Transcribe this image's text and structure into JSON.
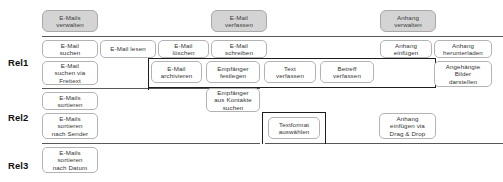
{
  "diagram": {
    "type": "story-map",
    "releases": [
      {
        "id": "rel1",
        "label": "Rel1"
      },
      {
        "id": "rel2",
        "label": "Rel2"
      },
      {
        "id": "rel3",
        "label": "Rel3"
      }
    ],
    "epics": [
      {
        "id": "epic-emails-verwalten",
        "label": "E-Mails\nverwalten"
      },
      {
        "id": "epic-email-verfassen",
        "label": "E-Mail\nverfassen"
      },
      {
        "id": "epic-anhang-verwalten",
        "label": "Anhang\nverwalten"
      }
    ],
    "stories": {
      "rel1_row1": [
        {
          "id": "email-suchen",
          "label": "E-Mail\nsuchen"
        },
        {
          "id": "email-lesen",
          "label": "E-Mail lesen"
        },
        {
          "id": "email-loeschen",
          "label": "E-Mail\nlöschen"
        },
        {
          "id": "email-schreiben",
          "label": "E-Mail\nschreiben"
        },
        {
          "id": "anhang-einfuegen",
          "label": "Anhang\neinfügen"
        },
        {
          "id": "anhang-herunterladen",
          "label": "Anhang\nherunterladen"
        }
      ],
      "rel1_row2": [
        {
          "id": "email-suchen-via-freitext",
          "label": "E-Mail\nsuchen via\nFreitext"
        },
        {
          "id": "email-archivieren",
          "label": "E-Mail\narchivieren"
        },
        {
          "id": "empfaenger-festlegen",
          "label": "Empfänger\nfestlegen"
        },
        {
          "id": "text-verfassen",
          "label": "Text\nverfassen"
        },
        {
          "id": "betreff-verfassen",
          "label": "Betreff\nverfassen"
        },
        {
          "id": "angehaengte-bilder-darstellen",
          "label": "Angehängte\nBilder\ndarstellen"
        }
      ],
      "rel2_row1": [
        {
          "id": "emails-sortieren",
          "label": "E-Mails\nsortieren"
        },
        {
          "id": "empfaenger-aus-kontakte-suchen",
          "label": "Empfänger\naus Kontakte\nsuchen"
        }
      ],
      "rel2_row2": [
        {
          "id": "emails-sortieren-nach-sender",
          "label": "E-Mails\nsortieren\nnach Sender"
        },
        {
          "id": "textformat-auswaehlen",
          "label": "Textformat\nauswählen"
        },
        {
          "id": "anhang-einfuegen-drag-drop",
          "label": "Anhang\neinfügen via\nDrag & Drop"
        }
      ],
      "rel3_row1": [
        {
          "id": "emails-sortieren-nach-datum",
          "label": "E-Mails\nsortieren\nnach Datum"
        }
      ]
    },
    "colors": {
      "epic_fill": "#d4d4d4",
      "epic_border": "#a8a8a8",
      "story_fill": "#ffffff",
      "story_border": "#b3b3b3",
      "release_line": "#585858",
      "group_outline": "#1d1d1d",
      "text": "#333333",
      "label_text": "#111111",
      "background": "#ffffff"
    }
  }
}
